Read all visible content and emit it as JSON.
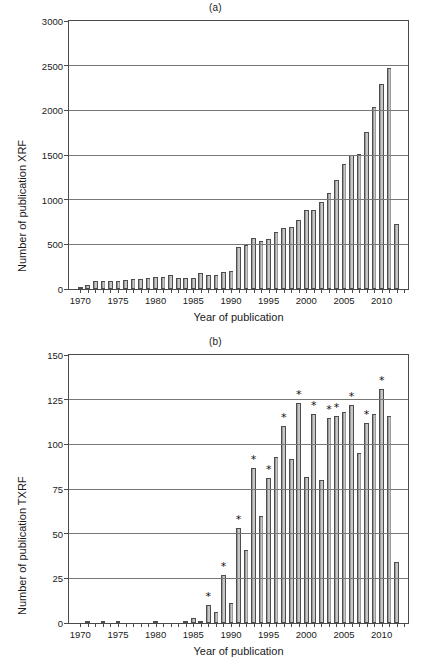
{
  "figure": {
    "panels": [
      {
        "title": "(a)",
        "ylabel": "Number of publication XRF",
        "xlabel": "Year of publication"
      },
      {
        "title": "(b)",
        "ylabel": "Number of publication TXRF",
        "xlabel": "Year of publication"
      }
    ]
  },
  "chart_data": [
    {
      "type": "bar",
      "title": "(a)",
      "xlabel": "Year of publication",
      "ylabel": "Number of publication XRF",
      "xlim": [
        1968.5,
        2013.5
      ],
      "ylim": [
        0,
        3000
      ],
      "yticks": [
        0,
        500,
        1000,
        1500,
        2000,
        2500,
        3000
      ],
      "xticks": [
        1970,
        1975,
        1980,
        1985,
        1990,
        1995,
        2000,
        2005,
        2010
      ],
      "grid": true,
      "bar_color": "#9a9a9a",
      "bar_edge_color": "#4d4d4d",
      "categories": [
        1970,
        1971,
        1972,
        1973,
        1974,
        1975,
        1976,
        1977,
        1978,
        1979,
        1980,
        1981,
        1982,
        1983,
        1984,
        1985,
        1986,
        1987,
        1988,
        1989,
        1990,
        1991,
        1992,
        1993,
        1994,
        1995,
        1996,
        1997,
        1998,
        1999,
        2000,
        2001,
        2002,
        2003,
        2004,
        2005,
        2006,
        2007,
        2008,
        2009,
        2010,
        2011,
        2012
      ],
      "values": [
        5,
        48,
        95,
        88,
        90,
        92,
        100,
        112,
        110,
        118,
        140,
        135,
        155,
        120,
        118,
        125,
        175,
        160,
        155,
        185,
        200,
        470,
        495,
        575,
        540,
        560,
        635,
        680,
        690,
        775,
        880,
        880,
        975,
        1080,
        1225,
        1400,
        1500,
        1510,
        1760,
        2035,
        2290,
        2470,
        730
      ]
    },
    {
      "type": "bar",
      "title": "(b)",
      "xlabel": "Year of publication",
      "ylabel": "Number of publication TXRF",
      "xlim": [
        1968.5,
        2013.5
      ],
      "ylim": [
        0,
        150
      ],
      "yticks": [
        0,
        25,
        50,
        75,
        100,
        125,
        150
      ],
      "xticks": [
        1970,
        1975,
        1980,
        1985,
        1990,
        1995,
        2000,
        2005,
        2010
      ],
      "grid": true,
      "bar_color": "#9a9a9a",
      "bar_edge_color": "#4d4d4d",
      "annotation_symbol": "*",
      "annotation_meaning": "conference year",
      "categories": [
        1970,
        1971,
        1972,
        1973,
        1974,
        1975,
        1976,
        1977,
        1978,
        1979,
        1980,
        1981,
        1982,
        1983,
        1984,
        1985,
        1986,
        1987,
        1988,
        1989,
        1990,
        1991,
        1992,
        1993,
        1994,
        1995,
        1996,
        1997,
        1998,
        1999,
        2000,
        2001,
        2002,
        2003,
        2004,
        2005,
        2006,
        2007,
        2008,
        2009,
        2010,
        2011,
        2012
      ],
      "values": [
        0,
        1,
        0,
        1,
        0,
        1,
        0,
        0,
        0,
        0,
        1,
        0,
        0,
        0,
        1,
        3,
        1,
        10,
        6,
        27,
        11,
        53,
        41,
        87,
        60,
        81,
        93,
        110,
        92,
        123,
        82,
        117,
        80,
        115,
        116,
        118,
        122,
        95,
        112,
        117,
        131,
        116,
        34
      ],
      "annotated_years": [
        1987,
        1989,
        1991,
        1993,
        1995,
        1997,
        1999,
        2001,
        2003,
        2004,
        2006,
        2008,
        2010
      ]
    }
  ]
}
